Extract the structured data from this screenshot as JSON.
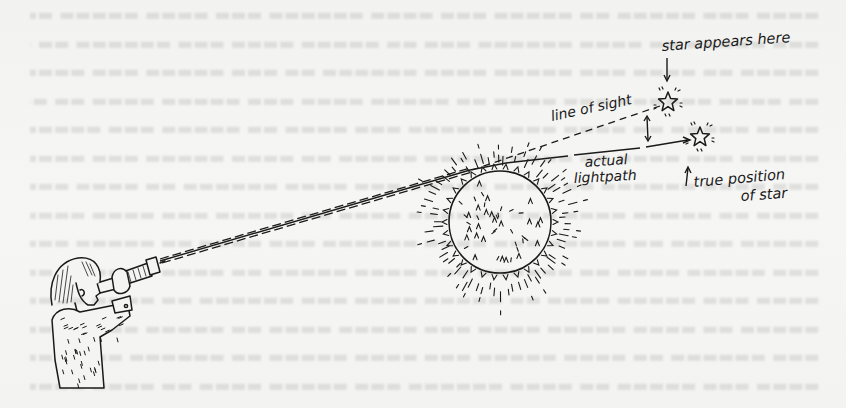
{
  "figure": {
    "labels": {
      "apparent_star": "star appears here",
      "line_of_sight": "line of sight",
      "actual_path_1": "actual",
      "actual_path_2": "lightpath",
      "true_position_1": "true position",
      "true_position_2": "of star"
    },
    "elements": {
      "observer": "person-with-telescope",
      "sun": "sun-with-rays",
      "apparent_star": "star-outline-icon",
      "true_star": "star-outline-icon",
      "displacement_arrow": "double-arrow-icon"
    },
    "colors": {
      "ink": "#1a1a1a",
      "paper": "#f4f4f2"
    }
  }
}
